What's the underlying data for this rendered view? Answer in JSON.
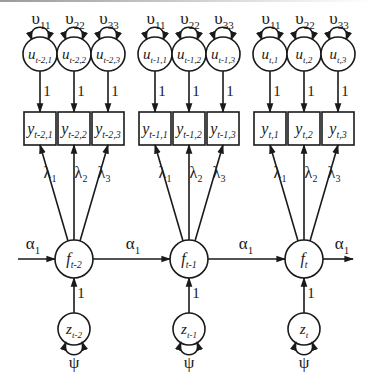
{
  "diagram": {
    "type": "structural-equation-path-diagram",
    "time_slices": [
      {
        "id": "t-2",
        "factor": {
          "name": "f",
          "sub": "t-2"
        },
        "disturbance": {
          "name": "z",
          "sub": "t-2",
          "variance_label": "ψ",
          "path_label": "1"
        },
        "indicators": [
          {
            "name": "y",
            "sub": "t-2,1",
            "loading": "λ",
            "loading_sub": "1"
          },
          {
            "name": "y",
            "sub": "t-2,2",
            "loading": "λ",
            "loading_sub": "2"
          },
          {
            "name": "y",
            "sub": "t-2,3",
            "loading": "λ",
            "loading_sub": "3"
          }
        ],
        "uniquenesses": [
          {
            "name": "u",
            "sub": "t-2,1",
            "variance": "υ",
            "variance_sub": "11",
            "path_label": "1"
          },
          {
            "name": "u",
            "sub": "t-2,2",
            "variance": "υ",
            "variance_sub": "22",
            "path_label": "1"
          },
          {
            "name": "u",
            "sub": "t-2,3",
            "variance": "υ",
            "variance_sub": "33",
            "path_label": "1"
          }
        ]
      },
      {
        "id": "t-1",
        "factor": {
          "name": "f",
          "sub": "t-1"
        },
        "disturbance": {
          "name": "z",
          "sub": "t-1",
          "variance_label": "ψ",
          "path_label": "1"
        },
        "indicators": [
          {
            "name": "y",
            "sub": "t-1,1",
            "loading": "λ",
            "loading_sub": "1"
          },
          {
            "name": "y",
            "sub": "t-1,2",
            "loading": "λ",
            "loading_sub": "2"
          },
          {
            "name": "y",
            "sub": "t-1,3",
            "loading": "λ",
            "loading_sub": "3"
          }
        ],
        "uniquenesses": [
          {
            "name": "u",
            "sub": "t-1,1",
            "variance": "υ",
            "variance_sub": "11",
            "path_label": "1"
          },
          {
            "name": "u",
            "sub": "t-1,2",
            "variance": "υ",
            "variance_sub": "22",
            "path_label": "1"
          },
          {
            "name": "u",
            "sub": "t-1,3",
            "variance": "υ",
            "variance_sub": "33",
            "path_label": "1"
          }
        ]
      },
      {
        "id": "t",
        "factor": {
          "name": "f",
          "sub": "t"
        },
        "disturbance": {
          "name": "z",
          "sub": "t",
          "variance_label": "ψ",
          "path_label": "1"
        },
        "indicators": [
          {
            "name": "y",
            "sub": "t,1",
            "loading": "λ",
            "loading_sub": "1"
          },
          {
            "name": "y",
            "sub": "t,2",
            "loading": "λ",
            "loading_sub": "2"
          },
          {
            "name": "y",
            "sub": "t,3",
            "loading": "λ",
            "loading_sub": "3"
          }
        ],
        "uniquenesses": [
          {
            "name": "u",
            "sub": "t,1",
            "variance": "υ",
            "variance_sub": "11",
            "path_label": "1"
          },
          {
            "name": "u",
            "sub": "t,2",
            "variance": "υ",
            "variance_sub": "22",
            "path_label": "1"
          },
          {
            "name": "u",
            "sub": "t,3",
            "variance": "υ",
            "variance_sub": "33",
            "path_label": "1"
          }
        ]
      }
    ],
    "autoregressive_paths": [
      {
        "label": "α",
        "sub": "1",
        "from": "(incoming)",
        "to": "f_t-2"
      },
      {
        "label": "α",
        "sub": "1",
        "from": "f_t-2",
        "to": "f_t-1"
      },
      {
        "label": "α",
        "sub": "1",
        "from": "f_t-1",
        "to": "f_t"
      },
      {
        "label": "α",
        "sub": "1",
        "from": "f_t",
        "to": "(outgoing)"
      }
    ],
    "colors": {
      "stroke": "#1a1a1a",
      "background": "#ffffff"
    }
  }
}
